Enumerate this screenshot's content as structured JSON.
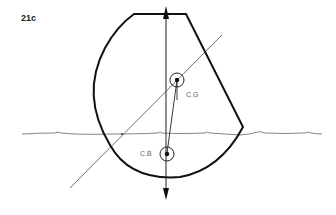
{
  "figure": {
    "label": "21c",
    "cg_label": "C.G",
    "cb_label": "C.B"
  },
  "colors": {
    "hull": "#111111",
    "waterline": "#777777",
    "axis": "#222222",
    "text": "#666666"
  },
  "elements": {
    "hull_outline": "heeled hull cross-section",
    "waterline": "water surface",
    "vertical_force_line": "buoyancy/gravity line with arrows up and down",
    "centerline": "tilted hull centerline (thin diagonal)",
    "center_of_gravity": "C.G marker with circle",
    "center_of_buoyancy": "C.B marker with circle"
  }
}
